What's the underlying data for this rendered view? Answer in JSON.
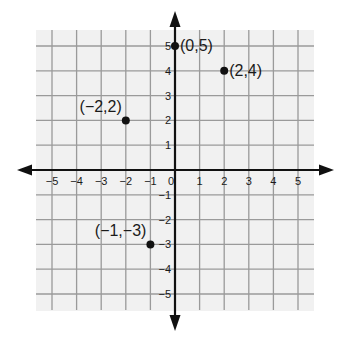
{
  "chart_data": {
    "type": "scatter",
    "title": "",
    "xlabel": "",
    "ylabel": "",
    "xlim": [
      -5,
      5
    ],
    "ylim": [
      -5,
      5
    ],
    "grid": true,
    "x_ticks": [
      -5,
      -4,
      -3,
      -2,
      -1,
      0,
      1,
      2,
      3,
      4,
      5
    ],
    "y_ticks": [
      -5,
      -4,
      -3,
      -2,
      -1,
      1,
      2,
      3,
      4,
      5
    ],
    "x_tick_labels": [
      "−5",
      "−4",
      "−3",
      "−2",
      "−1",
      "0",
      "1",
      "2",
      "3",
      "4",
      "5"
    ],
    "y_tick_labels": [
      "−5",
      "−4",
      "−3",
      "−2",
      "−1",
      "1",
      "2",
      "3",
      "4",
      "5"
    ],
    "points": [
      {
        "x": 0,
        "y": 5,
        "label": "(0,5)",
        "label_pos": "right"
      },
      {
        "x": 2,
        "y": 4,
        "label": "(2,4)",
        "label_pos": "right"
      },
      {
        "x": -2,
        "y": 2,
        "label": "(−2,2)",
        "label_pos": "upper-left"
      },
      {
        "x": -1,
        "y": -3,
        "label": "(−1,−3)",
        "label_pos": "upper-left"
      }
    ]
  },
  "colors": {
    "grid_background": "#f1f1f1",
    "grid_line": "#9a9a9a",
    "axis": "#111111",
    "point": "#111111",
    "text": "#1a1a1a"
  }
}
